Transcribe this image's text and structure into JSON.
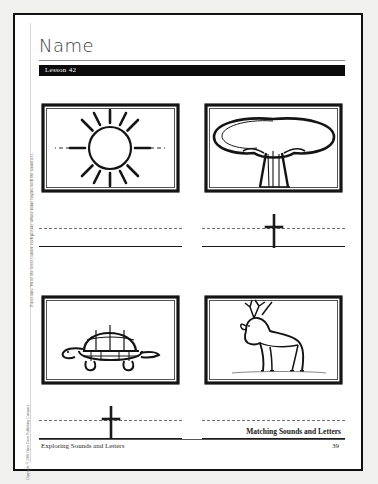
{
  "worksheet": {
    "name_label": "Name",
    "lesson_label": "Lesson 42",
    "directions": "Directions: Write the letter t under each picture whose name begins with the sound of t.",
    "copyright": "Copyright © 2001 Open Court Publishing Company",
    "footer_title": "Matching Sounds and Letters",
    "footer_left": "Exploring Sounds and Letters",
    "page_number": "39"
  },
  "exercises": [
    {
      "picture": "sun-illustration",
      "picture_label": "sun",
      "answer": ""
    },
    {
      "picture": "tree-illustration",
      "picture_label": "tree",
      "answer": "t"
    },
    {
      "picture": "turtle-illustration",
      "picture_label": "turtle",
      "answer": "t"
    },
    {
      "picture": "deer-illustration",
      "picture_label": "deer",
      "answer": ""
    }
  ],
  "colors": {
    "page_border": "#111111",
    "lesson_bar": "#0b0b0b",
    "baseline": "#1a1a1a",
    "midline": "#6f6f6f"
  }
}
